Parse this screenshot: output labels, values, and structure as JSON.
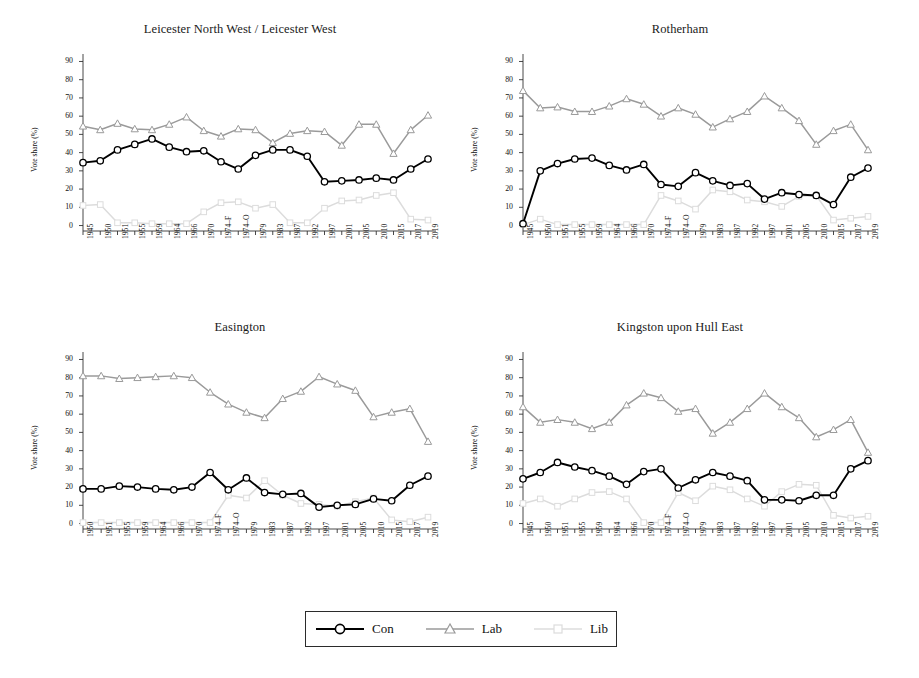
{
  "figure": {
    "ylabel": "Vote share (%)",
    "yticks": [
      0,
      10,
      20,
      30,
      40,
      50,
      60,
      70,
      80,
      90
    ],
    "ylim": [
      -3,
      93
    ],
    "colors": {
      "con": "#000000",
      "lab": "#9a9a9a",
      "lib": "#dcdcdc"
    }
  },
  "legend": {
    "items": [
      {
        "label": "Con",
        "marker": "circle",
        "color": "#000000"
      },
      {
        "label": "Lab",
        "marker": "triangle",
        "color": "#9a9a9a"
      },
      {
        "label": "Lib",
        "marker": "square",
        "color": "#dcdcdc"
      }
    ]
  },
  "chart_data": [
    {
      "type": "line",
      "title": "Leicester North West / Leicester West",
      "xlabel": "",
      "ylabel": "Vote share (%)",
      "ylim": [
        0,
        90
      ],
      "grid": false,
      "legend_position": "bottom",
      "categories": [
        "1945",
        "1950",
        "1951",
        "1955",
        "1959",
        "1964",
        "1966",
        "1970",
        "1974–F",
        "1974–O",
        "1979",
        "1983",
        "1987",
        "1992",
        "1997",
        "2001",
        "2005",
        "2010",
        "2015",
        "2017",
        "2019"
      ],
      "series": [
        {
          "name": "Con",
          "values": [
            34.5,
            35.5,
            41.5,
            44.5,
            47.5,
            43.0,
            40.5,
            41.0,
            35.0,
            31.0,
            38.5,
            41.5,
            41.5,
            38.0,
            24.0,
            24.5,
            25.0,
            26.0,
            25.0,
            31.0,
            36.5
          ]
        },
        {
          "name": "Lab",
          "values": [
            54.5,
            52.5,
            56.0,
            53.0,
            52.5,
            55.5,
            59.5,
            52.0,
            49.0,
            53.0,
            52.5,
            45.5,
            50.5,
            52.0,
            51.5,
            44.0,
            55.5,
            55.5,
            39.5,
            52.5,
            60.5
          ]
        },
        {
          "name": "Lib",
          "values": [
            11.0,
            11.5,
            1.5,
            1.5,
            1.0,
            1.0,
            1.0,
            7.5,
            12.5,
            13.0,
            9.5,
            11.5,
            1.5,
            1.5,
            9.5,
            13.5,
            14.0,
            16.5,
            18.0,
            3.5,
            3.0
          ]
        }
      ],
      "series_tail_note": {
        "Lab": "2019 value 52.0",
        "Con": "2019 value 36.5"
      }
    },
    {
      "type": "line",
      "title": "Rotherham",
      "xlabel": "",
      "ylabel": "Vote share (%)",
      "ylim": [
        0,
        90
      ],
      "grid": false,
      "legend_position": "bottom",
      "categories": [
        "1945",
        "1950",
        "1951",
        "1955",
        "1959",
        "1964",
        "1966",
        "1970",
        "1974–F",
        "1974–O",
        "1979",
        "1983",
        "1987",
        "1992",
        "1997",
        "2001",
        "2005",
        "2010",
        "2015",
        "2017",
        "2019"
      ],
      "series": [
        {
          "name": "Con",
          "values": [
            1.0,
            30.0,
            34.0,
            36.5,
            37.0,
            33.0,
            30.5,
            33.5,
            22.5,
            21.5,
            29.0,
            24.5,
            22.0,
            23.0,
            14.5,
            18.0,
            17.0,
            16.5,
            11.5,
            26.5,
            31.5
          ]
        },
        {
          "name": "Lab",
          "values": [
            74.0,
            64.5,
            65.0,
            62.5,
            62.5,
            65.5,
            69.5,
            66.5,
            60.0,
            64.5,
            61.0,
            54.0,
            58.5,
            62.5,
            71.0,
            64.5,
            57.5,
            44.5,
            52.0,
            55.5,
            41.5
          ]
        },
        {
          "name": "Lib",
          "values": [
            0.5,
            3.5,
            0.5,
            0.5,
            0.5,
            0.5,
            0.5,
            0.5,
            16.5,
            13.5,
            9.0,
            19.5,
            18.5,
            14.0,
            13.0,
            10.5,
            16.0,
            16.5,
            3.0,
            4.0,
            5.0
          ]
        }
      ]
    },
    {
      "type": "line",
      "title": "Easington",
      "xlabel": "",
      "ylabel": "Vote share (%)",
      "ylim": [
        0,
        90
      ],
      "grid": false,
      "legend_position": "bottom",
      "categories": [
        "1950",
        "1951",
        "1955",
        "1959",
        "1964",
        "1966",
        "1970",
        "1974–F",
        "1974–O",
        "1979",
        "1983",
        "1987",
        "1992",
        "1997",
        "2001",
        "2005",
        "2010",
        "2015",
        "2017",
        "2019"
      ],
      "series": [
        {
          "name": "Con",
          "values": [
            19.0,
            19.0,
            20.5,
            20.0,
            19.0,
            18.5,
            20.0,
            28.0,
            18.5,
            25.0,
            17.0,
            16.0,
            16.5,
            9.0,
            10.0,
            10.5,
            13.5,
            12.5,
            21.0,
            26.0
          ]
        },
        {
          "name": "Lab",
          "values": [
            81.0,
            81.0,
            79.5,
            80.0,
            80.5,
            81.0,
            80.0,
            72.0,
            65.5,
            61.0,
            58.0,
            68.5,
            72.5,
            80.5,
            76.5,
            73.0,
            58.5,
            61.0,
            63.0,
            45.0
          ]
        },
        {
          "name": "Lib",
          "values": [
            0.5,
            0.5,
            0.5,
            0.5,
            0.5,
            0.5,
            0.5,
            0.5,
            15.5,
            14.0,
            23.5,
            15.5,
            11.0,
            10.5,
            9.5,
            12.0,
            14.0,
            2.0,
            1.0,
            3.5
          ]
        }
      ]
    },
    {
      "type": "line",
      "title": "Kingston upon Hull East",
      "xlabel": "",
      "ylabel": "Vote share (%)",
      "ylim": [
        0,
        90
      ],
      "grid": false,
      "legend_position": "bottom",
      "categories": [
        "1945",
        "1950",
        "1951",
        "1955",
        "1959",
        "1964",
        "1966",
        "1970",
        "1974–F",
        "1974–O",
        "1979",
        "1983",
        "1987",
        "1992",
        "1997",
        "2001",
        "2005",
        "2010",
        "2015",
        "2017",
        "2019"
      ],
      "series": [
        {
          "name": "Con",
          "values": [
            24.5,
            28.0,
            33.5,
            31.0,
            29.0,
            26.0,
            21.5,
            28.5,
            30.0,
            19.5,
            24.0,
            28.0,
            26.0,
            23.5,
            13.0,
            13.0,
            12.5,
            15.5,
            15.5,
            30.0,
            34.5
          ]
        },
        {
          "name": "Lab",
          "values": [
            64.0,
            55.5,
            57.0,
            55.5,
            52.0,
            55.5,
            65.0,
            71.5,
            69.0,
            61.5,
            63.0,
            49.5,
            55.5,
            63.0,
            71.5,
            64.0,
            58.0,
            47.5,
            51.5,
            57.0,
            39.0
          ]
        },
        {
          "name": "Lib",
          "values": [
            11.0,
            13.5,
            9.5,
            13.5,
            17.0,
            17.5,
            13.5,
            0.5,
            0.5,
            17.0,
            12.5,
            20.5,
            18.5,
            13.5,
            9.5,
            17.5,
            21.5,
            21.0,
            4.5,
            3.0,
            4.0
          ]
        }
      ]
    }
  ]
}
